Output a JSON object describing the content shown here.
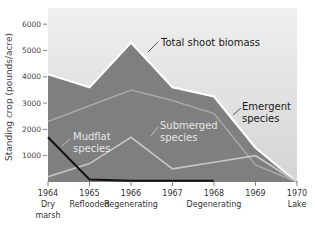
{
  "chart_data": {
    "type": "area",
    "title": "",
    "xlabel": "",
    "ylabel": "Standing crop (pounds/acre)",
    "ylim": [
      0,
      6500
    ],
    "yticks": [
      1000,
      2000,
      3000,
      4000,
      5000,
      6000
    ],
    "ytick_labels": [
      "1000",
      "2000",
      "3000",
      "4000",
      "5000",
      "6000"
    ],
    "categories": [
      "1964",
      "1965",
      "1966",
      "1967",
      "1968",
      "1969",
      "1970"
    ],
    "category_sublabels": [
      "Dry marsh",
      "Reflooded",
      "Regenerating",
      "",
      "Degenerating",
      "",
      "Lake"
    ],
    "grid": false,
    "legend": "inline annotations",
    "series": [
      {
        "name": "Total shoot biomass",
        "values": [
          4100,
          3600,
          5300,
          3600,
          3250,
          1300,
          0
        ],
        "style": "filled area, white edge"
      },
      {
        "name": "Emergent species",
        "values": [
          2300,
          2900,
          3500,
          3100,
          2600,
          650,
          0
        ],
        "style": "light gray line"
      },
      {
        "name": "Submerged species",
        "values": [
          200,
          700,
          1700,
          500,
          750,
          1000,
          0
        ],
        "style": "light gray line"
      },
      {
        "name": "Mudflat species",
        "values": [
          1700,
          100,
          50,
          50,
          50,
          null,
          null
        ],
        "style": "black line"
      }
    ],
    "annotations": [
      {
        "text": "Total shoot biomass",
        "points_to": "Total shoot biomass"
      },
      {
        "text": "Emergent species",
        "points_to": "Emergent species"
      },
      {
        "text": "Submerged species",
        "points_to": "Submerged species"
      },
      {
        "text": "Mudflat species",
        "points_to": "Mudflat species"
      }
    ]
  },
  "labels": {
    "ylabel": "Standing crop (pounds/acre)",
    "total": "Total shoot biomass",
    "emergent_1": "Emergent",
    "emergent_2": "species",
    "submerged_1": "Submerged",
    "submerged_2": "species",
    "mudflat_1": "Mudflat",
    "mudflat_2": "species",
    "y": [
      "1000",
      "2000",
      "3000",
      "4000",
      "5000",
      "6000"
    ],
    "x": [
      "1964",
      "1965",
      "1966",
      "1967",
      "1968",
      "1969",
      "1970"
    ],
    "x_sub": [
      "Dry",
      "Reflooded",
      "Regenerating",
      "",
      "Degenerating",
      "",
      "Lake"
    ],
    "x_sub2": [
      "marsh"
    ]
  },
  "colors": {
    "background_top": "#ededed",
    "background_bottom": "#d6d6d6",
    "total_fill": "#7f7f7f",
    "total_edge": "#ffffff",
    "emergent_line": "#a9a9a9",
    "submerged_line": "#c4c4c4",
    "mudflat_line": "#111111"
  }
}
